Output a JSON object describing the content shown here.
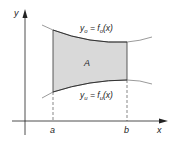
{
  "diagram": {
    "axis_x_label": "x",
    "axis_y_label": "y",
    "point_a": "a",
    "point_b": "b",
    "area_label": "A",
    "upper_curve": {
      "lhs": "y",
      "lhs_sub": "o",
      "eq": " = f",
      "rhs_sub": "o",
      "tail": "(x)"
    },
    "lower_curve": {
      "lhs": "y",
      "lhs_sub": "u",
      "eq": " = f",
      "rhs_sub": "u",
      "tail": "(x)"
    },
    "colors": {
      "fill": "#d9d9d9",
      "stroke": "#333333",
      "axis": "#222222"
    }
  }
}
